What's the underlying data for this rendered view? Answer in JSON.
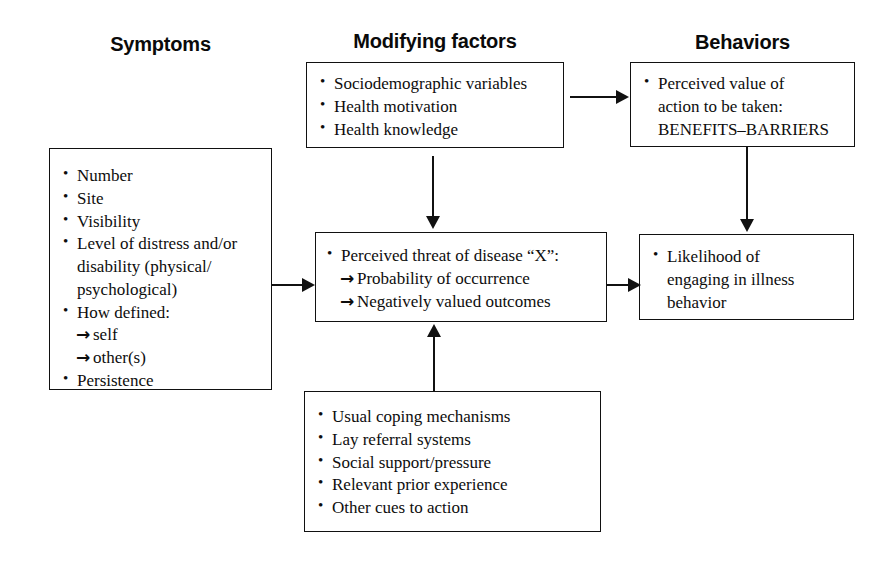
{
  "diagram": {
    "column_titles": [
      {
        "id": "symptoms",
        "label": "Symptoms"
      },
      {
        "id": "modifying-factors",
        "label": "Modifying factors"
      },
      {
        "id": "behaviors",
        "label": "Behaviors"
      }
    ],
    "boxes": {
      "symptoms": {
        "name": "symptoms-box",
        "items": [
          {
            "style": "bullet",
            "text": "Number"
          },
          {
            "style": "bullet",
            "text": "Site"
          },
          {
            "style": "bullet",
            "text": "Visibility"
          },
          {
            "style": "bullet",
            "text": "Level of distress and/or"
          },
          {
            "style": "cont",
            "text": "disability (physical/"
          },
          {
            "style": "cont",
            "text": "psychological)"
          },
          {
            "style": "bullet",
            "text": "How defined:"
          },
          {
            "style": "arrow",
            "text": "self"
          },
          {
            "style": "arrow",
            "text": "other(s)"
          },
          {
            "style": "bullet",
            "text": "Persistence"
          }
        ]
      },
      "modifying_factors": {
        "name": "modifying-factors-box",
        "items": [
          {
            "style": "bullet",
            "text": "Sociodemographic variables"
          },
          {
            "style": "bullet",
            "text": "Health motivation"
          },
          {
            "style": "bullet",
            "text": "Health knowledge"
          }
        ]
      },
      "behaviors": {
        "name": "perceived-value-box",
        "items": [
          {
            "style": "bullet",
            "text": "Perceived value of"
          },
          {
            "style": "cont",
            "text": "action to be taken:"
          },
          {
            "style": "cont",
            "text": "BENEFITS–BARRIERS"
          }
        ]
      },
      "perceived_threat": {
        "name": "perceived-threat-box",
        "items": [
          {
            "style": "bullet",
            "text": "Perceived threat of disease “X”:"
          },
          {
            "style": "arrow",
            "text": "Probability of occurrence"
          },
          {
            "style": "arrow",
            "text": "Negatively valued outcomes"
          }
        ]
      },
      "likelihood": {
        "name": "likelihood-box",
        "items": [
          {
            "style": "bullet",
            "text": "Likelihood of"
          },
          {
            "style": "cont",
            "text": "engaging in illness"
          },
          {
            "style": "cont",
            "text": "behavior"
          }
        ]
      },
      "cues": {
        "name": "cues-box",
        "items": [
          {
            "style": "bullet",
            "text": "Usual coping mechanisms"
          },
          {
            "style": "bullet",
            "text": "Lay referral systems"
          },
          {
            "style": "bullet",
            "text": "Social support/pressure"
          },
          {
            "style": "bullet",
            "text": "Relevant prior experience"
          },
          {
            "style": "bullet",
            "text": "Other cues to action"
          }
        ]
      }
    },
    "connectors": [
      {
        "id": "symptoms-to-threat",
        "direction": "right"
      },
      {
        "id": "modifying-to-behaviors",
        "direction": "right"
      },
      {
        "id": "modifying-to-threat",
        "direction": "down"
      },
      {
        "id": "behaviors-to-likelihood",
        "direction": "down"
      },
      {
        "id": "threat-to-likelihood",
        "direction": "right"
      },
      {
        "id": "cues-to-threat",
        "direction": "up"
      }
    ],
    "colors": {
      "line": "#111111",
      "text": "#0d0d0d",
      "background": "#ffffff"
    }
  }
}
